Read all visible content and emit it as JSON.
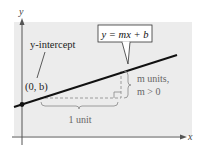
{
  "diagram": {
    "title_formula": "y = mx + b",
    "axis_labels": {
      "x": "x",
      "y": "y"
    },
    "annotations": {
      "y_intercept_label": "y-intercept",
      "point_label": "(0, b)",
      "rise_label_line1": "m units,",
      "rise_label_line2": "m > 0",
      "run_label": "1 unit"
    },
    "colors": {
      "panel_background": "#ececec",
      "line": "#111111",
      "axis": "#555555",
      "dashed": "#888888",
      "brace": "#888888",
      "label_text": "#222222",
      "secondary_text": "#666666",
      "box_border": "#333333",
      "box_background": "#ffffff"
    }
  }
}
